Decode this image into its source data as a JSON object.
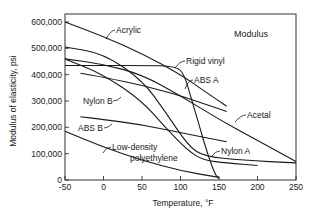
{
  "chart_data": {
    "type": "line",
    "title": "Modulus",
    "xlabel": "Temperature, °F",
    "ylabel": "Modulus of elasticity, psi",
    "xlim": [
      -50,
      250
    ],
    "ylim": [
      0,
      600000
    ],
    "xticks": [
      -50,
      0,
      50,
      100,
      150,
      200,
      250
    ],
    "yticks": [
      0,
      100000,
      200000,
      300000,
      400000,
      500000,
      600000
    ],
    "xtick_labels": [
      "-50",
      "0",
      "50",
      "100",
      "150",
      "200",
      "250"
    ],
    "ytick_labels": [
      "0",
      "100,000",
      "200,000",
      "300,000",
      "400,000",
      "500,000",
      "600,000"
    ],
    "grid": false,
    "legend": "inline labels",
    "series": [
      {
        "name": "Acrylic",
        "points": [
          [
            -50,
            600000
          ],
          [
            0,
            545000
          ],
          [
            50,
            480000
          ],
          [
            100,
            400000
          ],
          [
            130,
            340000
          ],
          [
            160,
            280000
          ]
        ]
      },
      {
        "name": "Rigid vinyl",
        "points": [
          [
            -50,
            435000
          ],
          [
            0,
            435000
          ],
          [
            50,
            435000
          ],
          [
            95,
            432000
          ],
          [
            105,
            400000
          ],
          [
            115,
            300000
          ],
          [
            125,
            200000
          ],
          [
            135,
            100000
          ],
          [
            145,
            20000
          ],
          [
            150,
            5000
          ]
        ]
      },
      {
        "name": "ABS A",
        "points": [
          [
            -30,
            405000
          ],
          [
            0,
            390000
          ],
          [
            50,
            360000
          ],
          [
            100,
            320000
          ],
          [
            130,
            290000
          ],
          [
            160,
            260000
          ]
        ]
      },
      {
        "name": "Acetal",
        "points": [
          [
            -50,
            460000
          ],
          [
            0,
            440000
          ],
          [
            50,
            400000
          ],
          [
            100,
            320000
          ],
          [
            150,
            230000
          ],
          [
            200,
            150000
          ],
          [
            250,
            70000
          ]
        ]
      },
      {
        "name": "Nylon B",
        "points": [
          [
            -50,
            460000
          ],
          [
            0,
            400000
          ],
          [
            50,
            300000
          ],
          [
            80,
            200000
          ],
          [
            110,
            110000
          ],
          [
            130,
            75000
          ],
          [
            160,
            65000
          ],
          [
            200,
            55000
          ]
        ]
      },
      {
        "name": "Nylon A",
        "points": [
          [
            -50,
            505000
          ],
          [
            0,
            480000
          ],
          [
            50,
            380000
          ],
          [
            80,
            260000
          ],
          [
            110,
            130000
          ],
          [
            130,
            90000
          ],
          [
            180,
            75000
          ],
          [
            250,
            65000
          ]
        ]
      },
      {
        "name": "ABS B",
        "points": [
          [
            -30,
            240000
          ],
          [
            0,
            230000
          ],
          [
            50,
            210000
          ],
          [
            100,
            180000
          ],
          [
            160,
            145000
          ]
        ]
      },
      {
        "name": "Low-density polyethylene",
        "points": [
          [
            -50,
            185000
          ],
          [
            0,
            125000
          ],
          [
            50,
            75000
          ],
          [
            100,
            35000
          ],
          [
            150,
            10000
          ]
        ]
      }
    ]
  },
  "labels": {
    "title": "Modulus",
    "xlabel": "Temperature, °F",
    "ylabel": "Modulus of elasticity, psi",
    "acrylic": "Acrylic",
    "rigid_vinyl": "Rigid vinyl",
    "abs_a": "ABS A",
    "acetal": "Acetal",
    "nylon_b": "Nylon B",
    "nylon_a": "Nylon A",
    "abs_b": "ABS B",
    "ldpe_1": "Low-density",
    "ldpe_2": "polyethylene"
  }
}
